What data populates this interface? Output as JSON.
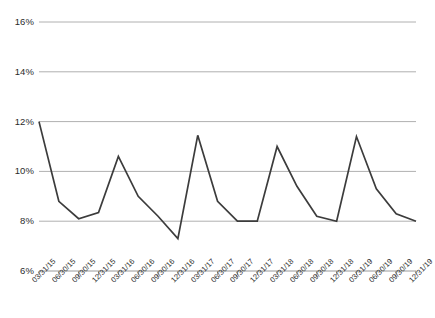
{
  "chart_data": {
    "type": "line",
    "title": "",
    "subtitle": "",
    "xlabel": "",
    "ylabel": "",
    "ylim": [
      6,
      16
    ],
    "ytick_values": [
      6,
      8,
      10,
      12,
      14,
      16
    ],
    "ytick_labels": [
      "6%",
      "8%",
      "10%",
      "12%",
      "14%",
      "16%"
    ],
    "grid": true,
    "grid_axis": "y",
    "legend": false,
    "legend_position": "none",
    "line_color": "#3c3c3c",
    "grid_color": "#b0b0b0",
    "axis_color": "#9a9a9a",
    "categories": [
      "03/31/15",
      "06/30/15",
      "09/30/15",
      "12/31/15",
      "03/31/16",
      "06/30/16",
      "09/30/16",
      "12/31/16",
      "03/31/17",
      "06/30/17",
      "09/30/17",
      "12/31/17",
      "03/31/18",
      "06/30/18",
      "09/30/18",
      "12/31/18",
      "03/31/19",
      "06/30/19",
      "09/30/19",
      "12/31/19"
    ],
    "values": [
      12.0,
      8.8,
      8.1,
      8.35,
      10.6,
      9.0,
      8.2,
      7.3,
      11.45,
      8.8,
      8.0,
      8.0,
      11.0,
      9.4,
      8.2,
      8.0,
      11.4,
      9.3,
      8.3,
      8.0
    ],
    "value_unit": "%"
  }
}
